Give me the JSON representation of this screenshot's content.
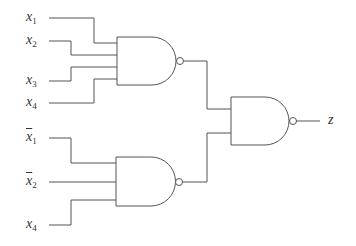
{
  "diagram": {
    "type": "logic-circuit",
    "gates": [
      {
        "id": "nand1",
        "type": "NAND",
        "inputs": [
          "x1",
          "x2",
          "x3",
          "x4"
        ]
      },
      {
        "id": "nand2",
        "type": "NAND",
        "inputs": [
          "x̄1",
          "x̄2",
          "x4"
        ]
      },
      {
        "id": "nand3",
        "type": "NAND",
        "inputs": [
          "nand1",
          "nand2"
        ],
        "output": "z"
      }
    ],
    "inputs_top": [
      {
        "var": "x",
        "sub": "1",
        "negated": false
      },
      {
        "var": "x",
        "sub": "2",
        "negated": false
      },
      {
        "var": "x",
        "sub": "3",
        "negated": false
      },
      {
        "var": "x",
        "sub": "4",
        "negated": false
      }
    ],
    "inputs_bottom": [
      {
        "var": "x",
        "sub": "1",
        "negated": true
      },
      {
        "var": "x",
        "sub": "2",
        "negated": true
      },
      {
        "var": "x",
        "sub": "4",
        "negated": false
      }
    ],
    "output_label": "z"
  }
}
